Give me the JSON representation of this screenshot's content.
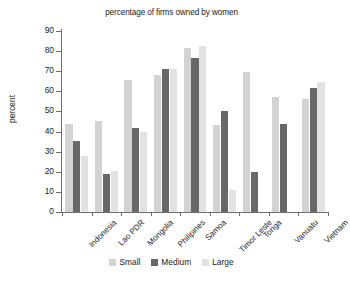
{
  "chart_data": {
    "type": "bar",
    "title": "percentage of firms owned by women",
    "xlabel": "",
    "ylabel": "percent",
    "ylim": [
      0,
      90
    ],
    "ytick_step": 10,
    "yticks": [
      0,
      10,
      20,
      30,
      40,
      50,
      60,
      70,
      80,
      90
    ],
    "grid": false,
    "legend_position": "bottom",
    "categories": [
      "Indonesia",
      "Lao PDR",
      "Mongolia",
      "Philipines",
      "Samoa",
      "Timor Leste",
      "Tonga",
      "Vanuatu",
      "Vietnam"
    ],
    "series": [
      {
        "name": "Small",
        "color": "#d3d3d3",
        "values": [
          44,
          45.5,
          65.5,
          68,
          81.5,
          43.5,
          69.5,
          57,
          56
        ]
      },
      {
        "name": "Medium",
        "color": "#686868",
        "values": [
          35.5,
          19,
          42,
          71,
          76.5,
          50,
          19.7,
          44,
          61.5
        ]
      },
      {
        "name": "Large",
        "color": "#e2e2e2",
        "values": [
          28,
          20.3,
          40,
          71,
          82.5,
          11,
          0,
          0,
          64.5
        ]
      }
    ]
  }
}
